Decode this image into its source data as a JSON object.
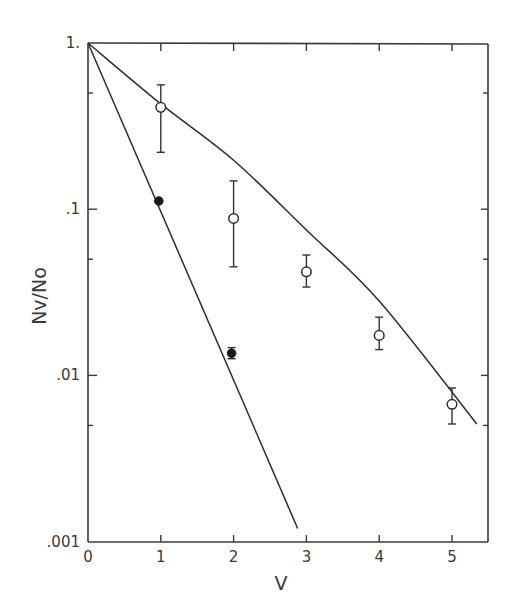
{
  "chart_data": {
    "type": "scatter",
    "title": "",
    "xlabel": "V",
    "ylabel": "Nv/No",
    "xscale": "linear",
    "yscale": "log",
    "xlim": [
      0,
      5.5
    ],
    "ylim": [
      0.001,
      1
    ],
    "grid": false,
    "legend": null,
    "x_ticks": [
      0,
      1,
      2,
      3,
      4,
      5
    ],
    "x_tick_labels": [
      "0",
      "1",
      "2",
      "3",
      "4",
      "5"
    ],
    "y_ticks": [
      1,
      0.1,
      0.01,
      0.001
    ],
    "y_tick_labels": [
      "1.",
      ".1",
      ".01",
      ".001"
    ],
    "series": [
      {
        "name": "open circles",
        "marker": "open-circle",
        "x": [
          1,
          2,
          3,
          4,
          5
        ],
        "y": [
          0.41,
          0.088,
          0.042,
          0.0174,
          0.0067
        ],
        "err_high": [
          0.56,
          0.148,
          0.053,
          0.0224,
          0.0084
        ],
        "err_low": [
          0.22,
          0.045,
          0.034,
          0.0143,
          0.0051
        ]
      },
      {
        "name": "filled circles",
        "marker": "filled-circle",
        "x": [
          1,
          2
        ],
        "y": [
          0.112,
          0.0136
        ],
        "err_high": [
          0.112,
          0.0147
        ],
        "err_low": [
          0.112,
          0.0126
        ]
      },
      {
        "name": "upper curve",
        "type": "line",
        "x": [
          0,
          1,
          2,
          3,
          4,
          5.34
        ],
        "y": [
          1,
          0.43,
          0.197,
          0.075,
          0.028,
          0.0051
        ]
      },
      {
        "name": "steep line",
        "type": "line",
        "x": [
          0,
          2.88
        ],
        "y": [
          1,
          0.0012
        ]
      }
    ]
  }
}
